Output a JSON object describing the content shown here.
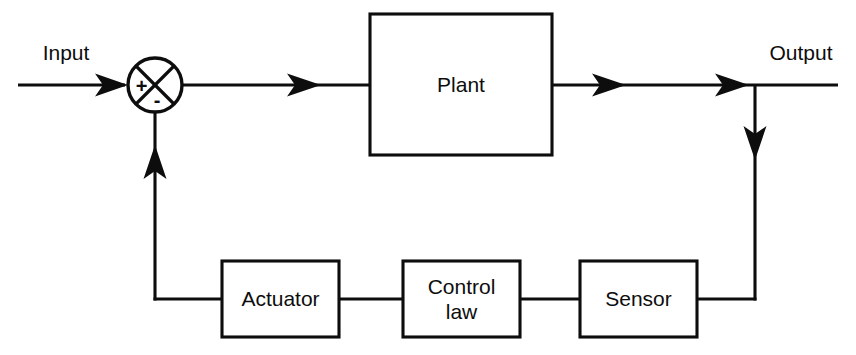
{
  "diagram": {
    "stroke_color": "#0d0d0d",
    "background_color": "#ffffff",
    "io": {
      "input_label": "Input",
      "output_label": "Output"
    },
    "summing_junction": {
      "name": "summing-junction",
      "plus_sign": "+",
      "minus_sign": "-",
      "cx": 155,
      "cy": 85,
      "r": 27
    },
    "blocks": [
      {
        "id": "plant",
        "label": "Plant",
        "x": 370,
        "y": 14,
        "w": 182,
        "h": 141,
        "lines": [
          "Plant"
        ]
      },
      {
        "id": "actuator",
        "label": "Actuator",
        "x": 222,
        "y": 261,
        "w": 117,
        "h": 76,
        "lines": [
          "Actuator"
        ]
      },
      {
        "id": "control-law",
        "label": "Control law",
        "x": 403,
        "y": 261,
        "w": 117,
        "h": 76,
        "lines": [
          "Control",
          "law"
        ]
      },
      {
        "id": "sensor",
        "label": "Sensor",
        "x": 580,
        "y": 261,
        "w": 117,
        "h": 76,
        "lines": [
          "Sensor"
        ]
      }
    ],
    "signals": [
      {
        "id": "input-to-sum",
        "from": "Input",
        "to": "summing junction"
      },
      {
        "id": "sum-to-plant",
        "from": "summing junction",
        "to": "Plant"
      },
      {
        "id": "plant-to-output",
        "from": "Plant",
        "to": "Output"
      },
      {
        "id": "output-to-sensor",
        "from": "Output branch",
        "to": "Sensor"
      },
      {
        "id": "sensor-to-control",
        "from": "Sensor",
        "to": "Control law"
      },
      {
        "id": "control-to-actuator",
        "from": "Control law",
        "to": "Actuator"
      },
      {
        "id": "actuator-to-sum",
        "from": "Actuator",
        "to": "summing junction"
      }
    ]
  }
}
